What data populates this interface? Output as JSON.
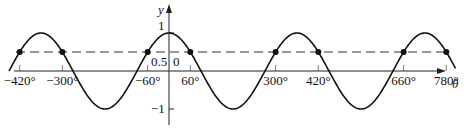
{
  "chart_data": {
    "type": "line",
    "title": "",
    "function": "cos",
    "xlabel": "θ",
    "ylabel": "y",
    "x_unit": "degrees",
    "xlim": [
      -450,
      820
    ],
    "ylim": [
      -1.2,
      1.2
    ],
    "x_ticks": [
      -420,
      -300,
      -60,
      60,
      300,
      420,
      660,
      780
    ],
    "x_tick_labels": [
      "−420°",
      "−300°",
      "−60°",
      "60°",
      "300°",
      "420°",
      "660°",
      "780°"
    ],
    "y_tick_labels": {
      "one": "1",
      "half": "0.5",
      "zero": "0",
      "neg_one": "−1"
    },
    "reference_line": {
      "y": 0.5,
      "style": "dashed"
    },
    "intersection_points": [
      {
        "x": -420,
        "y": 0.5
      },
      {
        "x": -300,
        "y": 0.5
      },
      {
        "x": -60,
        "y": 0.5
      },
      {
        "x": 60,
        "y": 0.5
      },
      {
        "x": 300,
        "y": 0.5
      },
      {
        "x": 420,
        "y": 0.5
      },
      {
        "x": 660,
        "y": 0.5
      },
      {
        "x": 780,
        "y": 0.5
      }
    ],
    "grid": false,
    "legend": "none"
  }
}
